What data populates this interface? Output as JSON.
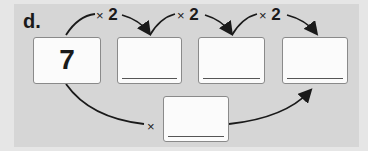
{
  "problem": {
    "label": "d.",
    "start_value": "7",
    "steps": [
      {
        "operator": "×",
        "operand": "2"
      },
      {
        "operator": "×",
        "operand": "2"
      },
      {
        "operator": "×",
        "operand": "2"
      }
    ],
    "boxes": [
      {
        "value": "7",
        "blank": false
      },
      {
        "value": "",
        "blank": true
      },
      {
        "value": "",
        "blank": true
      },
      {
        "value": "",
        "blank": true
      }
    ],
    "combined_step": {
      "operator": "×",
      "operand": "",
      "blank": true
    }
  },
  "colors": {
    "panel": "#d6d6d6",
    "box": "#fbfbfb",
    "arrow": "#1a1a1a"
  }
}
